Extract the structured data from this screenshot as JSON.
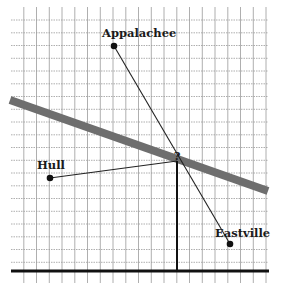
{
  "diagram": {
    "type": "map-grid",
    "grid": {
      "x_start": 11,
      "x_end": 268,
      "y_start": 7,
      "y_end": 283,
      "spacing": 12.75,
      "line_color": "#9a9a9a"
    },
    "road": {
      "x1": 10,
      "y1": 100,
      "x2": 268,
      "y2": 191,
      "color": "#6e6e6e",
      "width": 8
    },
    "baseline": {
      "x1": 11,
      "y1": 271,
      "x2": 269,
      "y2": 271
    },
    "vertical": {
      "x1": 177,
      "y1": 161,
      "x2": 177,
      "y2": 271
    },
    "unknown_marker": {
      "label": "?",
      "x": 177,
      "y": 158
    },
    "towns": [
      {
        "name": "Appalachee",
        "dot_x": 114,
        "dot_y": 46,
        "label_x": 102,
        "label_y": 37
      },
      {
        "name": "Hull",
        "dot_x": 50,
        "dot_y": 178,
        "label_x": 37,
        "label_y": 169
      },
      {
        "name": "Eastville",
        "dot_x": 230,
        "dot_y": 244,
        "label_x": 215,
        "label_y": 237
      }
    ],
    "connections": [
      {
        "from": "Appalachee",
        "to": "Eastville"
      },
      {
        "from": "Hull",
        "to": "?"
      }
    ]
  }
}
